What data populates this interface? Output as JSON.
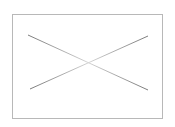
{
  "placeholder": {
    "icon": "image-placeholder-icon",
    "label": "",
    "frame": {
      "left": 12,
      "top": 14,
      "width": 151,
      "height": 105
    },
    "lines": [
      {
        "x1": 28,
        "y1": 35,
        "x2": 148,
        "y2": 90
      },
      {
        "x1": 30,
        "y1": 89,
        "x2": 148,
        "y2": 36
      }
    ]
  },
  "colors": {
    "background": "#ffffff",
    "border": "#b8b8b8",
    "line_dark": "#7a7a7a",
    "line_light": "#d4d4d4"
  }
}
